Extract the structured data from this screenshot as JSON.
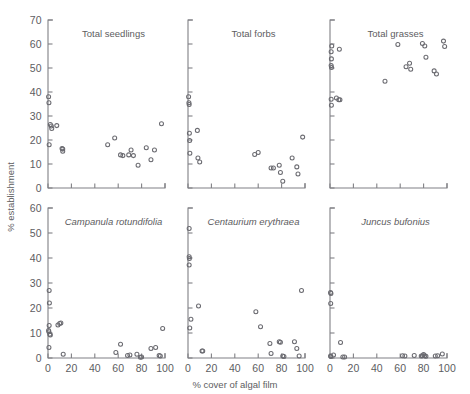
{
  "figure": {
    "xlabel": "% cover of algal film",
    "ylabel": "% establishment",
    "ghost_header": "",
    "xticks": [
      "0",
      "20",
      "40",
      "60",
      "80",
      "100"
    ],
    "yticks_top": [
      "0",
      "10",
      "20",
      "30",
      "40",
      "50",
      "60",
      "70"
    ],
    "yticks_bottom": [
      "0",
      "10",
      "20",
      "30",
      "40",
      "50",
      "60"
    ],
    "marker_color": "#6a6a70",
    "axis_color": "#808085",
    "text_color": "#5d5d61"
  },
  "chart_data": [
    {
      "type": "scatter",
      "title": "Total seedlings",
      "italic_title": false,
      "row": 0,
      "col": 0,
      "xlabel": "% cover of algal film",
      "ylabel": "% establishment",
      "xlim": [
        0,
        100
      ],
      "ylim": [
        0,
        70
      ],
      "xticks": [
        0,
        20,
        40,
        60,
        80,
        100
      ],
      "yticks": [
        0,
        10,
        20,
        30,
        40,
        50,
        60,
        70
      ],
      "grid": false,
      "points": [
        [
          0.5,
          38.0
        ],
        [
          0.8,
          35.5
        ],
        [
          1.0,
          18.0
        ],
        [
          2.0,
          26.5
        ],
        [
          2.8,
          25.8
        ],
        [
          3.2,
          24.8
        ],
        [
          7.5,
          26.0
        ],
        [
          12.0,
          16.5
        ],
        [
          12.6,
          16.2
        ],
        [
          12.6,
          15.3
        ],
        [
          51.0,
          18.0
        ],
        [
          57.0,
          20.8
        ],
        [
          62.0,
          13.8
        ],
        [
          64.0,
          13.5
        ],
        [
          69.0,
          13.8
        ],
        [
          71.0,
          15.8
        ],
        [
          73.0,
          13.5
        ],
        [
          77.0,
          9.5
        ],
        [
          84.0,
          16.8
        ],
        [
          88.0,
          11.8
        ],
        [
          91.0,
          15.8
        ],
        [
          97.0,
          26.8
        ]
      ]
    },
    {
      "type": "scatter",
      "title": "Total forbs",
      "italic_title": false,
      "row": 0,
      "col": 1,
      "xlabel": "% cover of algal film",
      "ylabel": "% establishment",
      "xlim": [
        0,
        100
      ],
      "ylim": [
        0,
        70
      ],
      "xticks": [
        0,
        20,
        40,
        60,
        80,
        100
      ],
      "yticks": [
        0,
        10,
        20,
        30,
        40,
        50,
        60,
        70
      ],
      "grid": false,
      "points": [
        [
          0.5,
          38.0
        ],
        [
          0.8,
          35.5
        ],
        [
          1.0,
          34.8
        ],
        [
          1.2,
          22.8
        ],
        [
          1.4,
          19.8
        ],
        [
          1.6,
          14.5
        ],
        [
          8.0,
          24.0
        ],
        [
          8.5,
          12.5
        ],
        [
          10.0,
          10.8
        ],
        [
          57.0,
          14.0
        ],
        [
          60.0,
          14.8
        ],
        [
          71.0,
          8.3
        ],
        [
          73.0,
          8.3
        ],
        [
          78.0,
          9.5
        ],
        [
          79.0,
          6.5
        ],
        [
          81.0,
          2.8
        ],
        [
          89.0,
          12.5
        ],
        [
          93.0,
          8.8
        ],
        [
          94.0,
          5.8
        ],
        [
          98.0,
          21.2
        ]
      ]
    },
    {
      "type": "scatter",
      "title": "Total grasses",
      "italic_title": false,
      "row": 0,
      "col": 2,
      "xlabel": "% cover of algal film",
      "ylabel": "% establishment",
      "xlim": [
        0,
        100
      ],
      "ylim": [
        0,
        70
      ],
      "xticks": [
        0,
        20,
        40,
        60,
        80,
        100
      ],
      "yticks": [
        0,
        10,
        20,
        30,
        40,
        50,
        60,
        70
      ],
      "grid": false,
      "points": [
        [
          1.5,
          59.2
        ],
        [
          1.0,
          56.8
        ],
        [
          1.2,
          53.8
        ],
        [
          1.0,
          51.0
        ],
        [
          1.3,
          50.2
        ],
        [
          8.0,
          57.8
        ],
        [
          1.0,
          37.0
        ],
        [
          1.2,
          34.5
        ],
        [
          5.5,
          37.5
        ],
        [
          7.5,
          36.8
        ],
        [
          8.5,
          36.8
        ],
        [
          47.0,
          44.5
        ],
        [
          58.0,
          59.8
        ],
        [
          65.0,
          50.5
        ],
        [
          68.0,
          52.0
        ],
        [
          69.0,
          49.5
        ],
        [
          79.0,
          60.2
        ],
        [
          81.0,
          59.2
        ],
        [
          82.0,
          54.5
        ],
        [
          89.0,
          48.8
        ],
        [
          91.0,
          47.5
        ],
        [
          97.0,
          61.2
        ],
        [
          98.0,
          59.0
        ]
      ]
    },
    {
      "type": "scatter",
      "title": "Campanula rotundifolia",
      "italic_title": true,
      "row": 1,
      "col": 0,
      "xlabel": "% cover of algal film",
      "ylabel": "% establishment",
      "xlim": [
        0,
        100
      ],
      "ylim": [
        0,
        60
      ],
      "xticks": [
        0,
        20,
        40,
        60,
        80,
        100
      ],
      "yticks": [
        0,
        10,
        20,
        30,
        40,
        50,
        60
      ],
      "grid": false,
      "points": [
        [
          1.0,
          27.0
        ],
        [
          1.2,
          22.0
        ],
        [
          1.0,
          13.0
        ],
        [
          0.5,
          11.0
        ],
        [
          0.8,
          10.5
        ],
        [
          1.5,
          9.5
        ],
        [
          2.0,
          9.2
        ],
        [
          0.8,
          4.2
        ],
        [
          8.5,
          13.2
        ],
        [
          10.0,
          13.8
        ],
        [
          11.0,
          14.0
        ],
        [
          13.0,
          1.5
        ],
        [
          58.0,
          2.2
        ],
        [
          62.0,
          5.5
        ],
        [
          68.0,
          1.0
        ],
        [
          70.0,
          1.2
        ],
        [
          76.0,
          1.5
        ],
        [
          79.0,
          0.3
        ],
        [
          80.0,
          0.4
        ],
        [
          88.0,
          3.8
        ],
        [
          92.0,
          4.2
        ],
        [
          95.0,
          1.0
        ],
        [
          96.0,
          0.8
        ],
        [
          98.0,
          11.8
        ]
      ]
    },
    {
      "type": "scatter",
      "title": "Centaurium erythraea",
      "italic_title": true,
      "row": 1,
      "col": 1,
      "xlabel": "% cover of algal film",
      "ylabel": "% establishment",
      "xlim": [
        0,
        100
      ],
      "ylim": [
        0,
        60
      ],
      "xticks": [
        0,
        20,
        40,
        60,
        80,
        100
      ],
      "yticks": [
        0,
        10,
        20,
        30,
        40,
        50,
        60
      ],
      "grid": false,
      "points": [
        [
          1.0,
          51.8
        ],
        [
          1.0,
          40.5
        ],
        [
          1.2,
          39.8
        ],
        [
          1.0,
          37.2
        ],
        [
          9.0,
          20.8
        ],
        [
          2.5,
          15.5
        ],
        [
          1.5,
          12.0
        ],
        [
          12.0,
          2.8
        ],
        [
          12.6,
          2.8
        ],
        [
          58.0,
          18.5
        ],
        [
          62.0,
          12.5
        ],
        [
          70.0,
          5.8
        ],
        [
          71.0,
          1.8
        ],
        [
          78.0,
          6.5
        ],
        [
          79.0,
          6.3
        ],
        [
          81.0,
          0.8
        ],
        [
          82.0,
          0.6
        ],
        [
          91.0,
          6.5
        ],
        [
          93.0,
          3.8
        ],
        [
          95.0,
          0.8
        ],
        [
          97.0,
          27.0
        ]
      ]
    },
    {
      "type": "scatter",
      "title": "Juncus bufonius",
      "italic_title": true,
      "row": 1,
      "col": 2,
      "xlabel": "% cover of algal film",
      "ylabel": "% establishment",
      "xlim": [
        0,
        100
      ],
      "ylim": [
        0,
        60
      ],
      "xticks": [
        0,
        20,
        40,
        60,
        80,
        100
      ],
      "yticks": [
        0,
        10,
        20,
        30,
        40,
        50,
        60
      ],
      "grid": false,
      "points": [
        [
          0.5,
          26.2
        ],
        [
          0.8,
          25.8
        ],
        [
          0.6,
          21.8
        ],
        [
          0.5,
          0.8
        ],
        [
          0.8,
          0.6
        ],
        [
          3.0,
          1.2
        ],
        [
          9.0,
          6.2
        ],
        [
          11.0,
          0.4
        ],
        [
          12.5,
          0.4
        ],
        [
          62.0,
          0.9
        ],
        [
          64.0,
          0.8
        ],
        [
          72.0,
          1.0
        ],
        [
          78.0,
          0.8
        ],
        [
          79.0,
          0.9
        ],
        [
          80.0,
          1.4
        ],
        [
          81.0,
          0.9
        ],
        [
          82.0,
          0.7
        ],
        [
          90.0,
          0.8
        ],
        [
          92.0,
          0.9
        ],
        [
          96.0,
          1.6
        ]
      ]
    }
  ]
}
